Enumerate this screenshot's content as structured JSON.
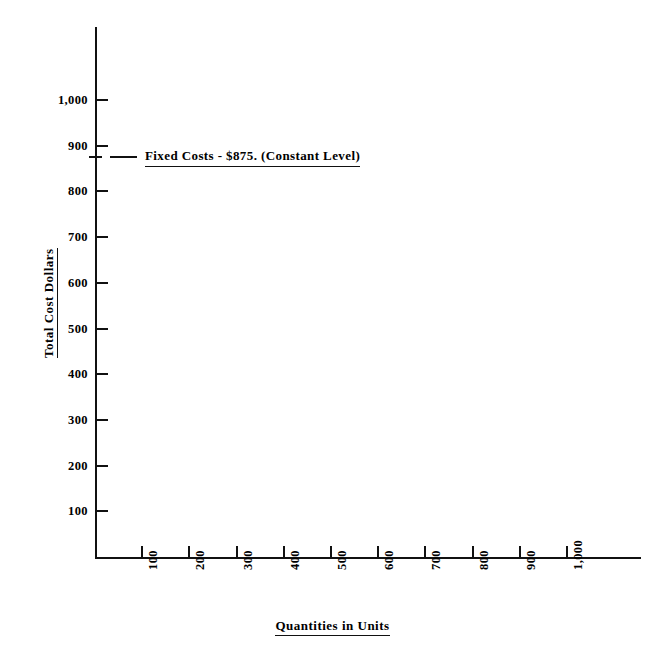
{
  "chart_data": {
    "type": "line",
    "title": "",
    "xlabel": "Quantities in Units",
    "ylabel": "Total Cost Dollars",
    "xlim": [
      0,
      1000
    ],
    "ylim": [
      0,
      1100
    ],
    "grid": false,
    "legend_position": "none",
    "x_tick_labels": [
      "100",
      "200",
      "300",
      "400",
      "500",
      "600",
      "700",
      "800",
      "900",
      "1,000"
    ],
    "x_tick_values": [
      100,
      200,
      300,
      400,
      500,
      600,
      700,
      800,
      900,
      1000
    ],
    "y_tick_labels": [
      "100",
      "200",
      "300",
      "400",
      "500",
      "600",
      "700",
      "800",
      "900",
      "1,000"
    ],
    "y_tick_values": [
      100,
      200,
      300,
      400,
      500,
      600,
      700,
      800,
      900,
      1000
    ],
    "series": [
      {
        "name": "Fixed Costs",
        "value": 875,
        "x": [
          0,
          1000
        ],
        "values": [
          875,
          875
        ],
        "style": "horizontal-constant"
      }
    ],
    "annotations": [
      {
        "text": "Fixed Costs  -  $875.  (Constant Level)",
        "y_value": 875,
        "underlined": true
      }
    ]
  },
  "axes": {
    "y_title": "Total Cost Dollars",
    "x_title": "Quantities in Units"
  },
  "annotation": {
    "label": "Fixed Costs  -  $875.  (Constant Level)"
  },
  "colors": {
    "ink": "#111111",
    "background": "#ffffff"
  }
}
